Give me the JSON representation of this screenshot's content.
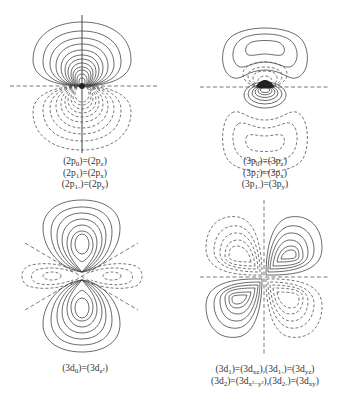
{
  "figure": {
    "panels": [
      {
        "id": "2p",
        "captions": [
          {
            "pre": "(2p",
            "sub": "0",
            "mid": ")=(2p",
            "sub2": "z",
            "post": ")"
          },
          {
            "pre": "(2p",
            "sub": "1",
            "mid": ")=(2p",
            "sub2": "x",
            "post": ")"
          },
          {
            "pre": "(2p",
            "sub": "1-",
            "mid": ")=(2p",
            "sub2": "y",
            "post": ")"
          }
        ]
      },
      {
        "id": "3p",
        "captions": [
          {
            "pre": "(3p",
            "sub": "0",
            "mid": ")=(3p",
            "sub2": "z",
            "post": ")"
          },
          {
            "pre": "(3p",
            "sub": "1",
            "mid": ")=(3p",
            "sub2": "x",
            "post": ")"
          },
          {
            "pre": "(3p",
            "sub": "1-",
            "mid": ")=(3p",
            "sub2": "y",
            "post": ")"
          }
        ]
      },
      {
        "id": "3d0",
        "captions": [
          {
            "pre": "(3d",
            "sub": "0",
            "mid": ")=(3d",
            "sub2": "z²",
            "post": ")"
          }
        ]
      },
      {
        "id": "3d-mixed",
        "captions": [
          {
            "text1": "(3d",
            "s1": "1",
            "t2": ")=(3d",
            "s2": "xz",
            "t3": "),(3d",
            "s3": "1-",
            "t4": ")=(3d",
            "s4": "yz",
            "t5": ")"
          },
          {
            "text1": "(3d",
            "s1": "2",
            "t2": ")=(3d",
            "s2": "x²−y²",
            "t3": "),(3d",
            "s3": "2-",
            "t4": ")=(3d",
            "s4": "xy",
            "t5": ")"
          }
        ]
      }
    ]
  }
}
